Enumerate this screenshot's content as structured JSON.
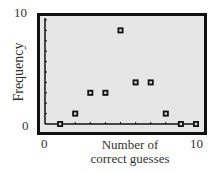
{
  "chart_data": {
    "type": "scatter",
    "title": "",
    "xlabel": "Number of correct guesses",
    "ylabel": "Frequency",
    "xlim": [
      0,
      10
    ],
    "ylim": [
      0,
      10
    ],
    "x_tick_labels": [
      "0",
      "10"
    ],
    "y_tick_labels": [
      "0",
      "10"
    ],
    "grid": false,
    "legend": null,
    "x": [
      1,
      2,
      3,
      4,
      5,
      6,
      7,
      8,
      9,
      10
    ],
    "y": [
      0,
      1,
      3,
      3,
      9,
      4,
      4,
      1,
      0,
      0
    ],
    "marker": "square"
  },
  "labels": {
    "y_top": "10",
    "y_bottom": "0",
    "x_left": "0",
    "x_right": "10",
    "ylabel": "Frequency",
    "xlabel_line1": "Number of",
    "xlabel_line2": "correct guesses"
  },
  "colors": {
    "plot_background": "#e6e6e6",
    "frame": "#111111",
    "marker": "#111111"
  }
}
